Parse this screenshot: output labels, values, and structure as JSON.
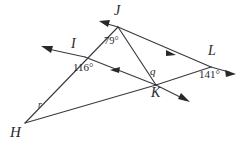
{
  "figure": {
    "type": "geometry-diagram",
    "background_color": "#ffffff",
    "stroke_color": "#3a3a42",
    "text_color": "#27272c",
    "width": 250,
    "height": 149
  },
  "vertices": [
    {
      "id": "J",
      "label": "J",
      "x": 118,
      "y": 27,
      "label_x": 118,
      "label_y": 8
    },
    {
      "id": "I",
      "label": "I",
      "x": 85,
      "y": 57,
      "label_x": 75,
      "label_y": 40
    },
    {
      "id": "L",
      "label": "L",
      "x": 211,
      "y": 67,
      "label_x": 212,
      "label_y": 48
    },
    {
      "id": "K",
      "label": "K",
      "x": 156,
      "y": 85,
      "label_x": 156,
      "label_y": 87
    },
    {
      "id": "H",
      "label": "H",
      "x": 25,
      "y": 123,
      "label_x": 15,
      "label_y": 126
    }
  ],
  "angles": [
    {
      "id": "angle-J",
      "label": "79°",
      "value": 79,
      "unit": "degrees",
      "x": 110,
      "y": 41,
      "vertex": "J"
    },
    {
      "id": "angle-I",
      "label": "116°",
      "value": 116,
      "unit": "degrees",
      "x": 78,
      "y": 66,
      "vertex": "I"
    },
    {
      "id": "angle-K",
      "label": "q",
      "value": "q",
      "unit": "variable",
      "x": 152,
      "y": 69,
      "vertex": "K"
    },
    {
      "id": "angle-L",
      "label": "141°",
      "value": 141,
      "unit": "degrees",
      "x": 204,
      "y": 72,
      "vertex": "L"
    },
    {
      "id": "angle-H",
      "label": "r",
      "value": "r",
      "unit": "variable",
      "x": 40,
      "y": 104,
      "vertex": "H"
    }
  ],
  "segments": [
    {
      "id": "H-to-J-ray",
      "from": "H",
      "to": "J",
      "extends_past": "J",
      "arrow_at": [
        100,
        21
      ]
    },
    {
      "id": "I-to-K-ray",
      "from": "I",
      "to": "K",
      "extends_past": "I",
      "arrow_at": [
        42,
        47
      ]
    },
    {
      "id": "J-to-L-ray",
      "from": "J",
      "to": "L",
      "extends_past": "L",
      "arrow_at": [
        234,
        73
      ]
    },
    {
      "id": "J-to-K-seg",
      "from": "J",
      "to": "K",
      "extends_past": null,
      "arrow_at": null
    },
    {
      "id": "H-to-K-ray",
      "from": "H",
      "to": "K",
      "extends_past": "K",
      "arrow_at": [
        189,
        101
      ]
    },
    {
      "id": "K-to-L-seg",
      "from": "K",
      "to": "L",
      "extends_past": null,
      "arrow_at": null
    }
  ],
  "midpoint_arrows": [
    {
      "id": "arrow-on-J-L",
      "x": 170,
      "y": 53,
      "direction": "right-down"
    },
    {
      "id": "arrow-on-K-I",
      "x": 113,
      "y": 71,
      "direction": "left-up"
    }
  ]
}
